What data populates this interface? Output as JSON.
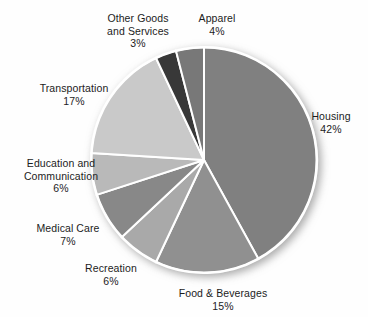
{
  "chart_data": {
    "type": "pie",
    "title": "",
    "subtitle": "",
    "xlabel": "",
    "ylabel": "",
    "legend_position": "none",
    "grid": false,
    "units": "percent",
    "start_angle_deg": 0,
    "direction": "clockwise",
    "categories": [
      "Housing",
      "Food & Beverages",
      "Recreation",
      "Medical Care",
      "Education and Communication",
      "Transportation",
      "Other Goods and Services",
      "Apparel"
    ],
    "values": [
      42,
      15,
      6,
      7,
      6,
      17,
      3,
      4
    ],
    "value_labels": [
      "42%",
      "15%",
      "6%",
      "7%",
      "6%",
      "17%",
      "3%",
      "4%"
    ],
    "colors": [
      "#808080",
      "#909090",
      "#a9a9a9",
      "#888888",
      "#b9b9b9",
      "#c9c9c9",
      "#383838",
      "#787878"
    ],
    "slice_separator_color": "#ffffff",
    "slices": [
      {
        "label": "Housing",
        "value": 42,
        "value_label": "42%",
        "color": "#808080"
      },
      {
        "label": "Food & Beverages",
        "value": 15,
        "value_label": "15%",
        "color": "#909090"
      },
      {
        "label": "Recreation",
        "value": 6,
        "value_label": "6%",
        "color": "#a9a9a9"
      },
      {
        "label": "Medical Care",
        "value": 7,
        "value_label": "7%",
        "color": "#888888"
      },
      {
        "label": "Education and Communication",
        "value": 6,
        "value_label": "6%",
        "color": "#b9b9b9"
      },
      {
        "label": "Transportation",
        "value": 17,
        "value_label": "17%",
        "color": "#c9c9c9"
      },
      {
        "label": "Other Goods and Services",
        "value": 3,
        "value_label": "3%",
        "color": "#383838"
      },
      {
        "label": "Apparel",
        "value": 4,
        "value_label": "4%",
        "color": "#787878"
      }
    ]
  },
  "labels": {
    "housing": {
      "name": "Housing",
      "value": "42%"
    },
    "food": {
      "name": "Food & Beverages",
      "value": "15%"
    },
    "recreation": {
      "name": "Recreation",
      "value": "6%"
    },
    "medical": {
      "name": "Medical Care",
      "value": "7%"
    },
    "education": {
      "name": "Education and",
      "name2": "Communication",
      "value": "6%"
    },
    "transportation": {
      "name": "Transportation",
      "value": "17%"
    },
    "other": {
      "name": "Other Goods",
      "name2": "and Services",
      "value": "3%"
    },
    "apparel": {
      "name": "Apparel",
      "value": "4%"
    }
  },
  "geometry": {
    "center_x": 204,
    "center_y": 160,
    "radius": 113
  }
}
